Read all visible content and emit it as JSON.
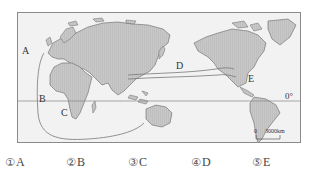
{
  "map": {
    "type": "world map with ocean routes",
    "labels": {
      "A": "A",
      "B": "B",
      "C": "C",
      "D": "D",
      "E": "E",
      "equator": "0°"
    },
    "scale": {
      "zero": "0",
      "distance": "3000km"
    },
    "colors": {
      "land": "#c4c4c4",
      "ocean": "#f2f2f2",
      "route": "#7a7a7a",
      "frame": "#8a8a8a"
    }
  },
  "options": [
    {
      "num": "①",
      "label": "A"
    },
    {
      "num": "②",
      "label": "B"
    },
    {
      "num": "③",
      "label": "C"
    },
    {
      "num": "④",
      "label": "D"
    },
    {
      "num": "⑤",
      "label": "E"
    }
  ]
}
